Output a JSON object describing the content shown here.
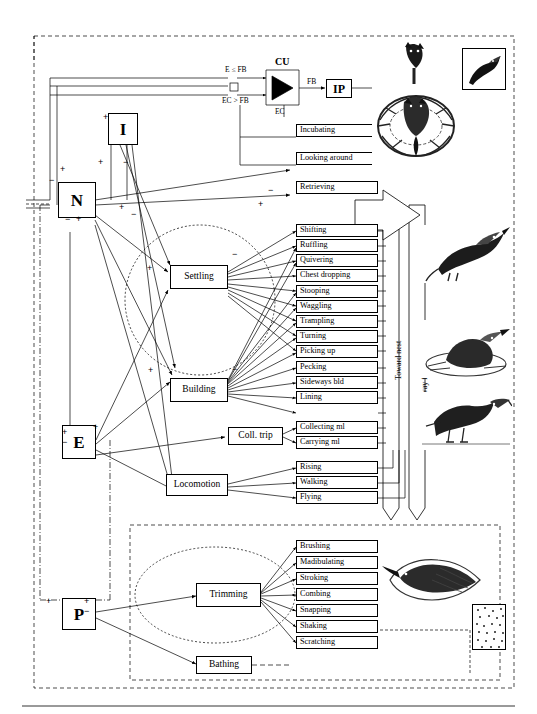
{
  "diagram": {
    "title_hidden": "",
    "nodes": [
      {
        "id": "I",
        "label": "I"
      },
      {
        "id": "N",
        "label": "N"
      },
      {
        "id": "E",
        "label": "E"
      },
      {
        "id": "P",
        "label": "P"
      },
      {
        "id": "IP",
        "label": "IP"
      }
    ],
    "cu": {
      "label": "CU",
      "inputs": [
        {
          "label": "E ≤ FB"
        },
        {
          "label": "EC > FB"
        }
      ],
      "output_label": "FB",
      "ec_label": "EC"
    },
    "groups": [
      {
        "id": "settling",
        "label": "Settling"
      },
      {
        "id": "building",
        "label": "Building"
      },
      {
        "id": "colltrip",
        "label": "Coll. trip"
      },
      {
        "id": "locomotion",
        "label": "Locomotion"
      },
      {
        "id": "trimming",
        "label": "Trimming"
      },
      {
        "id": "bathing",
        "label": "Bathing"
      }
    ],
    "top_acts": [
      {
        "label": "Incubating"
      },
      {
        "label": "Looking around"
      },
      {
        "label": "Retrieving"
      }
    ],
    "settling_acts": [
      {
        "label": "Shifting"
      },
      {
        "label": "Ruffling"
      },
      {
        "label": "Quivering"
      },
      {
        "label": "Chest dropping"
      }
    ],
    "building_acts": [
      {
        "label": "Stooping"
      },
      {
        "label": "Waggling"
      },
      {
        "label": "Trampling"
      },
      {
        "label": "Turning"
      },
      {
        "label": "Picking up"
      },
      {
        "label": "Pecking"
      },
      {
        "label": "Sideways bld"
      },
      {
        "label": "Lining"
      }
    ],
    "colltrip_acts": [
      {
        "label": "Collecting ml"
      },
      {
        "label": "Carrying ml"
      }
    ],
    "locomotion_acts": [
      {
        "label": "Rising"
      },
      {
        "label": "Walking"
      },
      {
        "label": "Flying"
      }
    ],
    "trimming_acts": [
      {
        "label": "Brushing"
      },
      {
        "label": "Madibulating"
      },
      {
        "label": "Stroking"
      },
      {
        "label": "Combing"
      },
      {
        "label": "Snapping"
      },
      {
        "label": "Shaking"
      },
      {
        "label": "Scratching"
      }
    ],
    "axis_labels": [
      {
        "label": "Toward nest"
      },
      {
        "label": "Away from nest"
      }
    ],
    "signs": [
      {
        "label": "+",
        "x": 103,
        "y": 113
      },
      {
        "label": "+",
        "x": 60,
        "y": 165
      },
      {
        "label": "−",
        "x": 49,
        "y": 176
      },
      {
        "label": "+",
        "x": 98,
        "y": 158
      },
      {
        "label": "−",
        "x": 123,
        "y": 158
      },
      {
        "label": "−",
        "x": 65,
        "y": 215
      },
      {
        "label": "+",
        "x": 76,
        "y": 215
      },
      {
        "label": "+",
        "x": 119,
        "y": 203
      },
      {
        "label": "−",
        "x": 131,
        "y": 210
      },
      {
        "label": "+",
        "x": 147,
        "y": 264
      },
      {
        "label": "−",
        "x": 232,
        "y": 250
      },
      {
        "label": "+",
        "x": 148,
        "y": 366
      },
      {
        "label": "−",
        "x": 232,
        "y": 365
      },
      {
        "label": "+",
        "x": 93,
        "y": 423
      },
      {
        "label": "+",
        "x": 62,
        "y": 428
      },
      {
        "label": "−",
        "x": 62,
        "y": 438
      },
      {
        "label": "+",
        "x": 46,
        "y": 597
      },
      {
        "label": "+",
        "x": 84,
        "y": 597
      },
      {
        "label": "−",
        "x": 84,
        "y": 607
      },
      {
        "label": "+",
        "x": 258,
        "y": 200
      },
      {
        "label": "−",
        "x": 268,
        "y": 186
      }
    ]
  }
}
